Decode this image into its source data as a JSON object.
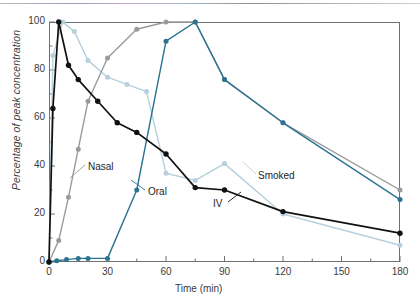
{
  "chart_data": {
    "type": "line",
    "title": "",
    "xlabel": "Time (min)",
    "ylabel": "Percentage of peak concentration",
    "xlim": [
      0,
      180
    ],
    "ylim": [
      0,
      100
    ],
    "xticks": [
      0,
      30,
      60,
      90,
      120,
      150,
      180
    ],
    "yticks": [
      0,
      20,
      40,
      60,
      80,
      100
    ],
    "x_minor_interval": 15,
    "y_minor_interval": 10,
    "grid": false,
    "legend": "inline-labels",
    "series": [
      {
        "name": "IV",
        "color": "#111111",
        "label_position": {
          "x": 213,
          "y": 198
        },
        "points": [
          {
            "x": 0,
            "y": 0
          },
          {
            "x": 2,
            "y": 64
          },
          {
            "x": 5,
            "y": 100
          },
          {
            "x": 10,
            "y": 82
          },
          {
            "x": 15,
            "y": 76
          },
          {
            "x": 25,
            "y": 67
          },
          {
            "x": 35,
            "y": 58
          },
          {
            "x": 45,
            "y": 54
          },
          {
            "x": 60,
            "y": 45
          },
          {
            "x": 75,
            "y": 31
          },
          {
            "x": 90,
            "y": 30
          },
          {
            "x": 120,
            "y": 21
          },
          {
            "x": 180,
            "y": 12
          }
        ]
      },
      {
        "name": "Smoked",
        "color": "#b7d0dd",
        "label_position": {
          "x": 258,
          "y": 170
        },
        "points": [
          {
            "x": 0,
            "y": 0
          },
          {
            "x": 2,
            "y": 86
          },
          {
            "x": 7,
            "y": 100
          },
          {
            "x": 13,
            "y": 96
          },
          {
            "x": 20,
            "y": 84
          },
          {
            "x": 30,
            "y": 77
          },
          {
            "x": 40,
            "y": 74
          },
          {
            "x": 50,
            "y": 71
          },
          {
            "x": 60,
            "y": 37
          },
          {
            "x": 75,
            "y": 34
          },
          {
            "x": 90,
            "y": 41
          },
          {
            "x": 120,
            "y": 20
          },
          {
            "x": 180,
            "y": 7
          }
        ]
      },
      {
        "name": "Nasal",
        "color": "#9a9a9a",
        "label_position": {
          "x": 88,
          "y": 161
        },
        "points": [
          {
            "x": 0,
            "y": 0
          },
          {
            "x": 5,
            "y": 9
          },
          {
            "x": 10,
            "y": 27
          },
          {
            "x": 15,
            "y": 47
          },
          {
            "x": 20,
            "y": 67
          },
          {
            "x": 30,
            "y": 85
          },
          {
            "x": 45,
            "y": 97
          },
          {
            "x": 60,
            "y": 100
          },
          {
            "x": 75,
            "y": 100
          },
          {
            "x": 90,
            "y": 76
          },
          {
            "x": 120,
            "y": 58
          },
          {
            "x": 180,
            "y": 30
          }
        ]
      },
      {
        "name": "Oral",
        "color": "#2b7391",
        "label_position": {
          "x": 148,
          "y": 186
        },
        "points": [
          {
            "x": 0,
            "y": 0
          },
          {
            "x": 4,
            "y": 0.5
          },
          {
            "x": 9,
            "y": 1
          },
          {
            "x": 15,
            "y": 1.5
          },
          {
            "x": 20,
            "y": 1.5
          },
          {
            "x": 30,
            "y": 1.5
          },
          {
            "x": 45,
            "y": 30
          },
          {
            "x": 60,
            "y": 92
          },
          {
            "x": 75,
            "y": 100
          },
          {
            "x": 90,
            "y": 76
          },
          {
            "x": 120,
            "y": 58
          },
          {
            "x": 180,
            "y": 26
          }
        ]
      }
    ]
  }
}
